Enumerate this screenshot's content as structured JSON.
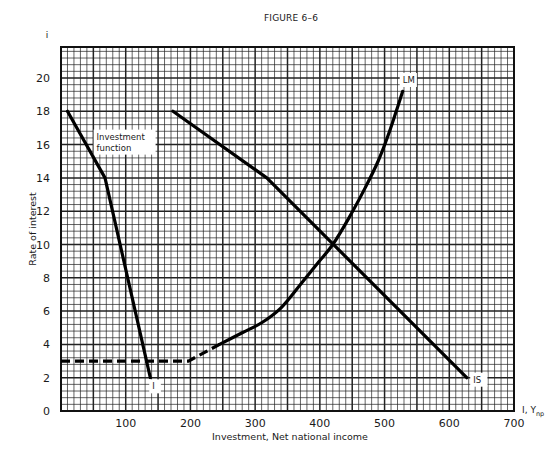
{
  "figure": {
    "title": "FIGURE 6–6"
  },
  "chart_data": {
    "type": "line",
    "title": "FIGURE 6–6",
    "xlabel": "Investment, Net national income",
    "ylabel": "Rate of interest",
    "x_axis_symbol": "I, Y",
    "x_axis_symbol_subscript": "np",
    "y_axis_symbol": "i",
    "xlim": [
      0,
      700
    ],
    "ylim": [
      0,
      22
    ],
    "x_ticks": [
      100,
      200,
      300,
      400,
      500,
      600,
      700
    ],
    "x_tick_labels": [
      "100",
      "200",
      "300",
      "400",
      "500",
      "600",
      "700"
    ],
    "y_ticks": [
      0,
      2,
      4,
      6,
      8,
      10,
      12,
      14,
      16,
      18,
      20
    ],
    "y_tick_labels": [
      "0",
      "2",
      "4",
      "6",
      "8",
      "10",
      "12",
      "14",
      "16",
      "18",
      "20"
    ],
    "grid": {
      "on": true,
      "major_x_step": 50,
      "minor_x_step": 10,
      "major_y_step": 2,
      "minor_y_step": 0.4
    },
    "series": [
      {
        "name": "Investment function",
        "label": "I",
        "annotation": "Investment function",
        "style": "solid",
        "points": [
          [
            10,
            18
          ],
          [
            68,
            14
          ],
          [
            138,
            2
          ]
        ]
      },
      {
        "name": "IS",
        "label": "IS",
        "style": "solid",
        "points": [
          [
            173,
            18
          ],
          [
            318,
            14
          ],
          [
            627,
            2
          ]
        ]
      },
      {
        "name": "LM",
        "label": "LM",
        "segments": [
          {
            "style": "dashed",
            "points": [
              [
                0,
                3
              ],
              [
                197,
                3
              ],
              [
                245,
                4
              ]
            ]
          },
          {
            "style": "solid",
            "points": [
              [
                245,
                4
              ],
              [
                280,
                4.7
              ],
              [
                310,
                5.3
              ],
              [
                340,
                6.2
              ],
              [
                370,
                7.6
              ],
              [
                395,
                8.8
              ],
              [
                420,
                10
              ],
              [
                445,
                11.6
              ],
              [
                470,
                13.4
              ],
              [
                490,
                15
              ],
              [
                505,
                16.5
              ],
              [
                518,
                18
              ],
              [
                528,
                19.2
              ]
            ]
          }
        ]
      }
    ],
    "annotations": [
      {
        "text": "Investment function",
        "x": 55,
        "y": 16.3
      },
      {
        "text": "I",
        "x": 141,
        "y": 1.3
      },
      {
        "text": "IS",
        "x": 637,
        "y": 1.7
      },
      {
        "text": "LM",
        "x": 528,
        "y": 19.7
      }
    ],
    "intersection": {
      "x": 420,
      "y": 10
    },
    "legend": "none"
  }
}
